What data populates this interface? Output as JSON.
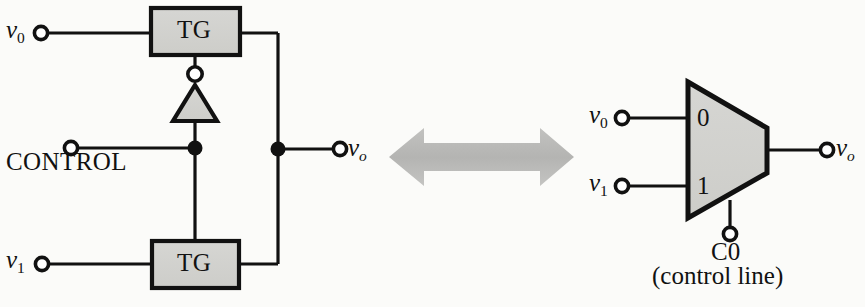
{
  "figure": {
    "colors": {
      "background": "#fbfbf9",
      "ink": "#111111",
      "block_fill": "#d2d2cf",
      "arrow_fill": "#b9b9b7"
    }
  },
  "left_circuit": {
    "name": "transmission-gate-implementation",
    "inputs": [
      {
        "id": "v0",
        "base": "v",
        "subscript": "0"
      },
      {
        "id": "v1",
        "base": "v",
        "subscript": "1"
      }
    ],
    "control": {
      "label": "CONTROL"
    },
    "output": {
      "base": "v",
      "subscript": "o"
    },
    "gates": [
      {
        "id": "tg-top",
        "label": "TG"
      },
      {
        "id": "tg-bottom",
        "label": "TG"
      }
    ],
    "inverter": {
      "name": "inverter",
      "label": ""
    }
  },
  "equivalence": {
    "symbol": "double-headed-arrow",
    "meaning": "is equivalent to"
  },
  "right_circuit": {
    "name": "multiplexer-symbol",
    "inputs": [
      {
        "id": "v0",
        "base": "v",
        "subscript": "0",
        "port": "0"
      },
      {
        "id": "v1",
        "base": "v",
        "subscript": "1",
        "port": "1"
      }
    ],
    "port_labels": [
      "0",
      "1"
    ],
    "output": {
      "base": "v",
      "subscript": "o"
    },
    "control": {
      "label": "C0",
      "caption": "(control line)"
    }
  }
}
